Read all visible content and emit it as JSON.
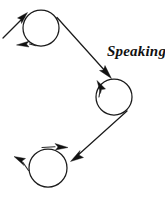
{
  "diagram": {
    "title": "Speaking",
    "canvas": {
      "width": 165,
      "height": 198,
      "background": "#ffffff"
    },
    "stroke_color": "#1b1b1b",
    "label": {
      "text": "Speaking",
      "x": 107,
      "y": 44,
      "style": "italic-serif-bold",
      "font_size_px": 15
    },
    "nodes": [
      {
        "id": "node-top",
        "name": "top-loop",
        "cx": 41,
        "cy": 28,
        "r": 18,
        "loop_direction": "counterclockwise",
        "loop_arrow_label": "bottom-left arrowhead pointing left"
      },
      {
        "id": "node-middle",
        "name": "middle-loop",
        "cx": 114,
        "cy": 97,
        "r": 18,
        "loop_direction": "clockwise",
        "loop_arrow_label": "left-side arrowhead pointing up"
      },
      {
        "id": "node-bottom",
        "name": "bottom-loop",
        "cx": 48,
        "cy": 168,
        "r": 19,
        "loop_direction": "clockwise",
        "loop_arrow_label": "top arrowhead pointing right and left arrowhead pointing up-left"
      }
    ],
    "edges": [
      {
        "id": "edge-entry",
        "name": "entry-arrow-into-top-loop",
        "from": {
          "x": 3,
          "y": 38
        },
        "to": {
          "x": 26,
          "y": 15
        },
        "arrowhead": "end",
        "direction": "up-right"
      },
      {
        "id": "edge-top-to-middle",
        "name": "arrow-top-loop-to-middle-loop",
        "from": {
          "x": 58,
          "y": 18
        },
        "to": {
          "x": 110,
          "y": 76
        },
        "arrowhead": "end",
        "direction": "down-right"
      },
      {
        "id": "edge-middle-to-bottom",
        "name": "arrow-middle-loop-to-bottom-loop",
        "from": {
          "x": 125,
          "y": 113
        },
        "to": {
          "x": 72,
          "y": 160
        },
        "arrowhead": "end",
        "direction": "down-left"
      }
    ]
  }
}
